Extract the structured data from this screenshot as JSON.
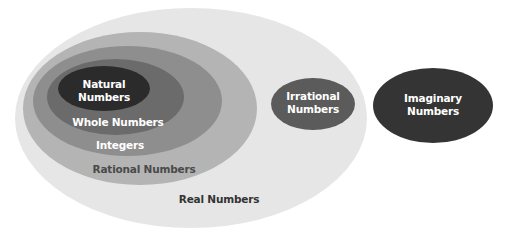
{
  "diagram": {
    "sets": {
      "real": {
        "label": "Real Numbers",
        "color": "#e6e6e6"
      },
      "rational": {
        "label": "Rational Numbers",
        "color": "#b4b4b4"
      },
      "integers": {
        "label": "Integers",
        "color": "#8e8e8e"
      },
      "whole": {
        "label": "Whole Numbers",
        "color": "#6b6b6b"
      },
      "natural": {
        "label_line1": "Natural",
        "label_line2": "Numbers",
        "color": "#2b2b2b"
      },
      "irrational": {
        "label_line1": "Irrational",
        "label_line2": "Numbers",
        "color": "#5b5b5b"
      },
      "imaginary": {
        "label_line1": "Imaginary",
        "label_line2": "Numbers",
        "color": "#343434"
      }
    },
    "relationships": [
      {
        "inner": "Natural Numbers",
        "outer": "Whole Numbers"
      },
      {
        "inner": "Whole Numbers",
        "outer": "Integers"
      },
      {
        "inner": "Integers",
        "outer": "Rational Numbers"
      },
      {
        "inner": "Rational Numbers",
        "outer": "Real Numbers"
      },
      {
        "inner": "Irrational Numbers",
        "outer": "Real Numbers"
      },
      {
        "separate": "Imaginary Numbers"
      }
    ]
  }
}
